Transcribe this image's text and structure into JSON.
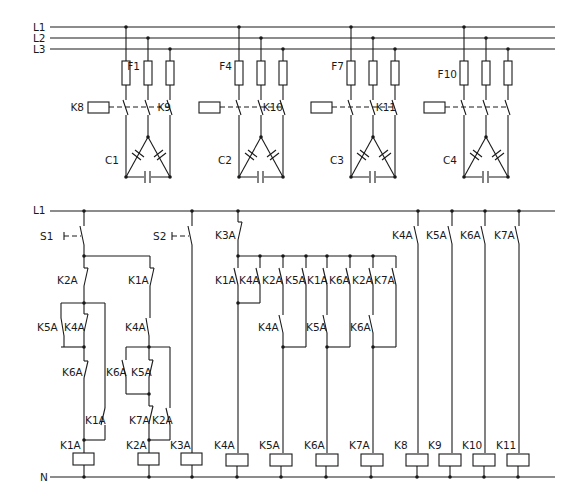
{
  "power_circuit": {
    "lines": [
      "L1",
      "L2",
      "L3"
    ],
    "banks": [
      {
        "fuse": "F1",
        "contactor": "K8",
        "capacitor": "C1"
      },
      {
        "fuse": "F4",
        "contactor": "K9",
        "capacitor": "C2"
      },
      {
        "fuse": "F7",
        "contactor": "K10",
        "capacitor": "C3"
      },
      {
        "fuse": "F10",
        "contactor": "K11",
        "capacitor": "C4"
      }
    ]
  },
  "control_circuit": {
    "supply": "L1",
    "neutral": "N",
    "switches": {
      "s1": "S1",
      "s2": "S2"
    },
    "contacts": {
      "k2a_nc": "K2A",
      "k1a_nc": "K1A",
      "k5a_no": "K5A",
      "k4a_nc_left": "K4A",
      "k4a_no_mid": "K4A",
      "k6a_nc_left": "K6A",
      "k6a_no_mid": "K6A",
      "k5a_nc_mid": "K5A",
      "k1a_no_left": "K1A",
      "k7a_nc": "K7A",
      "k2a_no": "K2A",
      "k3a_nc": "K3A",
      "bus": [
        "K1A",
        "K4A",
        "K2A",
        "K5A",
        "K1A",
        "K6A",
        "K2A",
        "K7A"
      ],
      "row2": [
        "K4A",
        "K5A",
        "K6A"
      ],
      "right": [
        "K4A",
        "K5A",
        "K6A",
        "K7A"
      ]
    },
    "coils": [
      "K1A",
      "K2A",
      "K3A",
      "K4A",
      "K5A",
      "K6A",
      "K7A",
      "K8",
      "K9",
      "K10",
      "K11"
    ]
  }
}
